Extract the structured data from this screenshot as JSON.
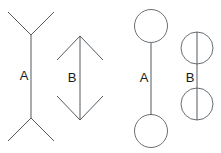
{
  "canvas": {
    "width": 221,
    "height": 153,
    "background_color": "#ffffff",
    "line_color": "#555a5e",
    "label_color": "#1a1a1a"
  },
  "figures": [
    {
      "id": "left-fins",
      "label": "A",
      "label_x": 24,
      "label_y": 80,
      "shaft": {
        "x": 31,
        "y1": 35,
        "y2": 118
      },
      "fins": [
        {
          "x1": 8,
          "y1": 12,
          "x2": 31,
          "y2": 35
        },
        {
          "x1": 54,
          "y1": 12,
          "x2": 31,
          "y2": 35
        },
        {
          "x1": 8,
          "y1": 141,
          "x2": 31,
          "y2": 118
        },
        {
          "x1": 54,
          "y1": 141,
          "x2": 31,
          "y2": 118
        }
      ]
    },
    {
      "id": "left-arrows",
      "label": "B",
      "label_x": 72,
      "label_y": 82,
      "shaft": {
        "x": 80,
        "y1": 36,
        "y2": 120
      },
      "fins": [
        {
          "x1": 57,
          "y1": 60,
          "x2": 80,
          "y2": 36
        },
        {
          "x1": 103,
          "y1": 60,
          "x2": 80,
          "y2": 36
        },
        {
          "x1": 57,
          "y1": 96,
          "x2": 80,
          "y2": 120
        },
        {
          "x1": 103,
          "y1": 96,
          "x2": 80,
          "y2": 120
        }
      ]
    },
    {
      "id": "right-tangent-circles",
      "label": "A",
      "label_x": 144,
      "label_y": 82,
      "shaft": {
        "x": 151,
        "y1": 43,
        "y2": 115
      },
      "circles": [
        {
          "cx": 151,
          "cy": 26,
          "r": 16.5
        },
        {
          "cx": 151,
          "cy": 131,
          "r": 16.5
        }
      ]
    },
    {
      "id": "right-overlap-circles",
      "label": "B",
      "label_x": 190,
      "label_y": 82,
      "shaft": {
        "x": 197,
        "y1": 32,
        "y2": 120
      },
      "circles": [
        {
          "cx": 197,
          "cy": 48,
          "r": 16
        },
        {
          "cx": 197,
          "cy": 104,
          "r": 16
        }
      ]
    }
  ]
}
